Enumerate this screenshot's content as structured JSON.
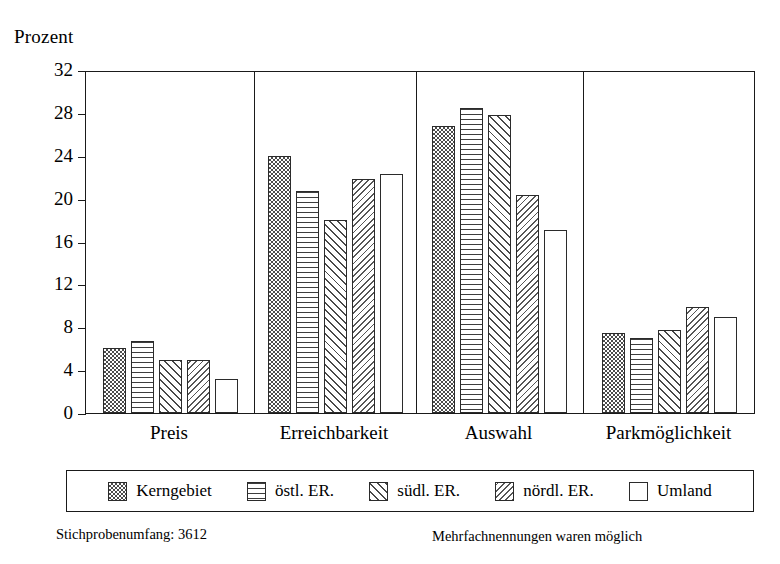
{
  "chart_data": {
    "type": "bar",
    "title": "",
    "ylabel": "Prozent",
    "xlabel": "",
    "ylim": [
      0,
      32
    ],
    "yticks": [
      0,
      4,
      8,
      12,
      16,
      20,
      24,
      28,
      32
    ],
    "grid": false,
    "legend_position": "bottom",
    "categories": [
      "Preis",
      "Erreichbarkeit",
      "Auswahl",
      "Parkmöglichkeit"
    ],
    "series": [
      {
        "name": "Kerngebiet",
        "pattern": "checkerboard",
        "values": [
          6.1,
          24.0,
          26.8,
          7.5
        ]
      },
      {
        "name": "östl. ER.",
        "pattern": "horizontal-lines",
        "values": [
          6.7,
          20.7,
          28.5,
          7.0
        ]
      },
      {
        "name": "südl. ER.",
        "pattern": "diagonal-hatch-fwd",
        "values": [
          4.9,
          18.0,
          27.8,
          7.7
        ]
      },
      {
        "name": "nördl. ER.",
        "pattern": "diagonal-hatch-bwd",
        "values": [
          4.9,
          21.8,
          20.3,
          9.9
        ]
      },
      {
        "name": "Umland",
        "pattern": "solid-white",
        "values": [
          3.2,
          22.3,
          17.1,
          9.0
        ]
      }
    ],
    "annotations": {
      "sample_size": "Stichprobenumfang: 3612",
      "multiple_answers": "Mehrfachnennungen waren möglich"
    }
  },
  "axis": {
    "y_title": "Prozent",
    "y_tick_labels": [
      "32",
      "28",
      "24",
      "20",
      "16",
      "12",
      "8",
      "4",
      "0"
    ]
  },
  "legend": {
    "items": [
      {
        "label": "Kerngebiet"
      },
      {
        "label": "östl. ER."
      },
      {
        "label": "südl. ER."
      },
      {
        "label": "nördl. ER."
      },
      {
        "label": "Umland"
      }
    ]
  },
  "footer": {
    "left": "Stichprobenumfang: 3612",
    "right": "Mehrfachnennungen waren möglich"
  }
}
